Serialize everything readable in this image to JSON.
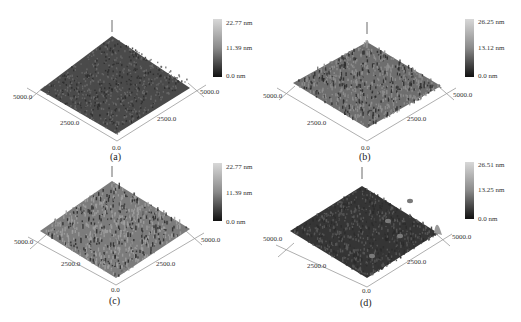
{
  "figure": {
    "panels": [
      {
        "id": "a",
        "caption": "(a)",
        "colorbar": {
          "max": "22.77 nm",
          "mid": "11.39 nm",
          "min": "0.0 nm"
        },
        "axes": {
          "left_end": "5000.0",
          "left_mid": "2500.0",
          "origin": "0.0",
          "right_mid": "2500.0",
          "right_end": "5000.0"
        },
        "surface_tone": "#4a4a4a",
        "surface_tone_light": "#6a6a6a",
        "roughness": 0.3,
        "offset": [
          0,
          0
        ]
      },
      {
        "id": "b",
        "caption": "(b)",
        "colorbar": {
          "max": "26.25 nm",
          "mid": "13.12 nm",
          "min": "0.0 nm"
        },
        "axes": {
          "left_end": "5000.0",
          "left_mid": "2500.0",
          "origin": "0.0",
          "right_mid": "2500.0",
          "right_end": "5000.0"
        },
        "surface_tone": "#6e6e6e",
        "surface_tone_light": "#909090",
        "roughness": 0.8,
        "offset": [
          260,
          0
        ]
      },
      {
        "id": "c",
        "caption": "(c)",
        "colorbar": {
          "max": "22.77 nm",
          "mid": "11.39 nm",
          "min": "0.0 nm"
        },
        "axes": {
          "left_end": "5000.0",
          "left_mid": "2500.0",
          "origin": "0.0",
          "right_mid": "2500.0",
          "right_end": "5000.0"
        },
        "surface_tone": "#7c7c7c",
        "surface_tone_light": "#a0a0a0",
        "roughness": 0.9,
        "offset": [
          0,
          161
        ]
      },
      {
        "id": "d",
        "caption": "(d)",
        "colorbar": {
          "max": "26.51 nm",
          "mid": "13.25 nm",
          "min": "0.0 nm"
        },
        "axes": {
          "left_end": "5000.0",
          "left_mid": "2500.0",
          "origin": "0.0",
          "right_mid": "2500.0",
          "right_end": "5000.0"
        },
        "surface_tone": "#353535",
        "surface_tone_light": "#5a5a5a",
        "roughness": 0.5,
        "offset": [
          260,
          161
        ]
      }
    ]
  }
}
